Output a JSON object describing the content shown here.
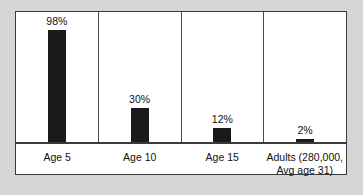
{
  "chart_data": {
    "type": "bar",
    "title": "",
    "subtitle": "",
    "xlabel": "",
    "ylabel": "",
    "ylim": [
      0,
      100
    ],
    "grid": false,
    "legend": false,
    "legend_position": "none",
    "value_label_suffix": "%",
    "categories": [
      "Age 5",
      "Age 10",
      "Age 15",
      "Adults (280,000, Avg age 31)"
    ],
    "values": [
      98,
      30,
      12,
      2
    ],
    "value_labels": [
      "98%",
      "30%",
      "12%",
      "2%"
    ],
    "bar_color": "#1a1a1a",
    "panel_background": "#ffffff",
    "page_background": "#d6d6d6",
    "axis_color": "#3a3a3a",
    "text_color": "#111111",
    "bars": [
      {
        "category": "Age 5",
        "value": 98,
        "label": "98%"
      },
      {
        "category": "Age 10",
        "value": 30,
        "label": "30%"
      },
      {
        "category": "Age 15",
        "value": 12,
        "label": "12%"
      },
      {
        "category": "Adults (280,000, Avg age 31)",
        "value": 2,
        "label": "2%"
      }
    ]
  }
}
